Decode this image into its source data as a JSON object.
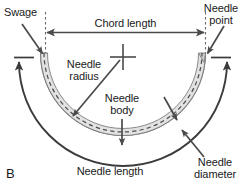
{
  "figure": {
    "panel_letter": "B",
    "background_color": "#ffffff",
    "line_color": "#4a4a4a",
    "dark_line_color": "#3b3b3b",
    "needle_fill_color": "#e0e0e0",
    "needle_edge_color": "#8a8a8a",
    "dash_color": "#5a5a5a",
    "text_color": "#1a1a1a"
  },
  "labels": {
    "swage": "Swage",
    "needle_point_line1": "Needle",
    "needle_point_line2": "point",
    "chord_length": "Chord length",
    "needle_radius_line1": "Needle",
    "needle_radius_line2": "radius",
    "needle_body_line1": "Needle",
    "needle_body_line2": "body",
    "needle_length": "Needle length",
    "needle_diameter_line1": "Needle",
    "needle_diameter_line2": "diameter"
  },
  "icons": {
    "center_marker": "cross-marker",
    "chord_arrow": "double-headed-arrow",
    "leader_arrow": "single-headed-arrow"
  }
}
